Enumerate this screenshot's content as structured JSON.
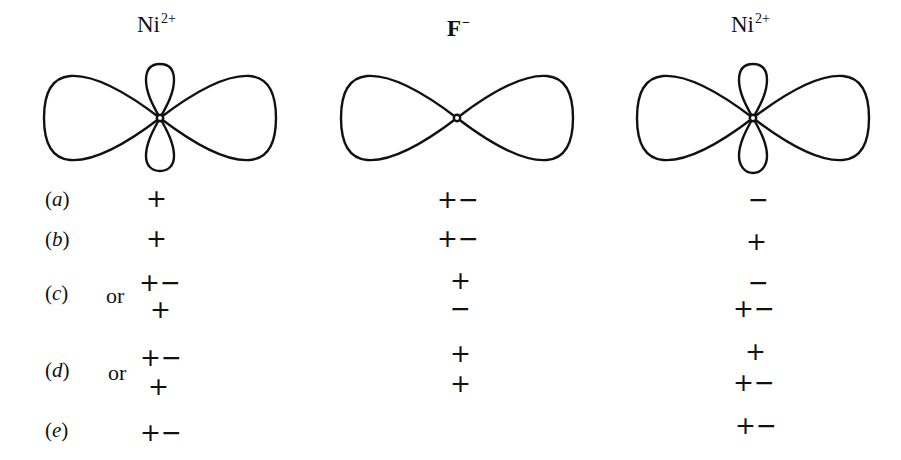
{
  "ions": [
    {
      "label": "Ni",
      "charge": "2+",
      "orbital": "d-orbital (dz2-like, large horizontal lobes with small vertical lobes)"
    },
    {
      "label": "F",
      "charge": "−",
      "orbital": "p-orbital (horizontal two-lobe)"
    },
    {
      "label": "Ni",
      "charge": "2+",
      "orbital": "d-orbital (dz2-like, large horizontal lobes with small vertical lobes)"
    }
  ],
  "rows": [
    {
      "label": "a",
      "prefix": "",
      "left": [
        "+"
      ],
      "middle": [
        "+−"
      ],
      "right": [
        "−"
      ]
    },
    {
      "label": "b",
      "prefix": "",
      "left": [
        "+"
      ],
      "middle": [
        "+−"
      ],
      "right": [
        "+"
      ]
    },
    {
      "label": "c",
      "prefix": "or",
      "left": [
        "+−",
        "+"
      ],
      "middle": [
        "+",
        "−"
      ],
      "right": [
        "−",
        "+−"
      ]
    },
    {
      "label": "d",
      "prefix": "or",
      "left": [
        "+−",
        "+"
      ],
      "middle": [
        "+",
        "+"
      ],
      "right": [
        "+",
        "+−"
      ]
    },
    {
      "label": "e",
      "prefix": "",
      "left": [
        "+−"
      ],
      "middle": [],
      "right": [
        "+−"
      ]
    }
  ]
}
